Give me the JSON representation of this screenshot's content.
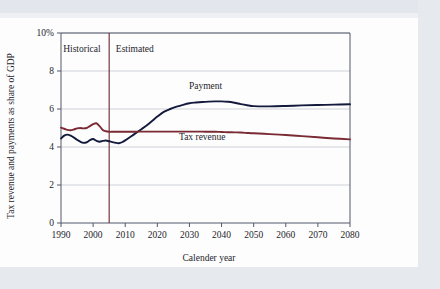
{
  "figure": {
    "background_color": "#fdfdfe",
    "page_edge_color": "#e6e9ee"
  },
  "chart_data": {
    "type": "line",
    "title": "",
    "subtitle": "",
    "xlabel": "Calender year",
    "ylabel": "Tax revenue and payments as share of GDP",
    "xlim": [
      1990,
      2080
    ],
    "ylim": [
      0,
      10
    ],
    "grid": true,
    "grid_axis": "y",
    "legend_position": "inline-annotation",
    "x_ticks": [
      1990,
      2000,
      2010,
      2020,
      2030,
      2040,
      2050,
      2060,
      2070,
      2080
    ],
    "x_tick_labels": [
      "1990",
      "2000",
      "2010",
      "2020",
      "2030",
      "2040",
      "2050",
      "2060",
      "2070",
      "2080"
    ],
    "y_ticks": [
      0,
      2,
      4,
      6,
      8,
      10
    ],
    "y_tick_labels": [
      "0",
      "2",
      "4",
      "6",
      "8",
      "10%"
    ],
    "annotations": [
      {
        "name": "historical-label",
        "text": "Historical",
        "x": 1996.5,
        "y": 9.0
      },
      {
        "name": "estimated-label",
        "text": "Estimated",
        "x": 2013.0,
        "y": 9.0
      },
      {
        "name": "payment-label",
        "text": "Payment",
        "x": 2035.0,
        "y": 7.05
      },
      {
        "name": "tax-revenue-label",
        "text": "Tax revenue",
        "x": 2034.0,
        "y": 4.35
      }
    ],
    "divider": {
      "name": "historical-estimated-divider",
      "x": 2005,
      "color": "#6b2430",
      "label_left": "Historical",
      "label_right": "Estimated"
    },
    "x": [
      1990,
      1991,
      1992,
      1993,
      1994,
      1995,
      1996,
      1997,
      1998,
      1999,
      2000,
      2001,
      2002,
      2003,
      2004,
      2005,
      2006,
      2007,
      2008,
      2009,
      2010,
      2012,
      2014,
      2016,
      2018,
      2020,
      2022,
      2024,
      2026,
      2028,
      2030,
      2032,
      2034,
      2036,
      2038,
      2040,
      2042,
      2044,
      2046,
      2048,
      2050,
      2055,
      2060,
      2065,
      2070,
      2075,
      2080
    ],
    "series": [
      {
        "name": "Payment",
        "color": "#141a3c",
        "values": [
          4.45,
          4.6,
          4.65,
          4.6,
          4.5,
          4.38,
          4.28,
          4.22,
          4.25,
          4.36,
          4.42,
          4.33,
          4.28,
          4.32,
          4.34,
          4.3,
          4.26,
          4.22,
          4.2,
          4.25,
          4.35,
          4.58,
          4.82,
          5.05,
          5.32,
          5.6,
          5.85,
          6.0,
          6.12,
          6.22,
          6.3,
          6.34,
          6.37,
          6.39,
          6.4,
          6.4,
          6.38,
          6.33,
          6.26,
          6.2,
          6.15,
          6.14,
          6.16,
          6.19,
          6.21,
          6.23,
          6.25
        ]
      },
      {
        "name": "Tax revenue",
        "color": "#7a2a33",
        "values": [
          5.02,
          4.96,
          4.9,
          4.88,
          4.92,
          4.98,
          5.0,
          4.98,
          5.0,
          5.1,
          5.2,
          5.25,
          5.1,
          4.9,
          4.83,
          4.8,
          4.8,
          4.8,
          4.8,
          4.8,
          4.8,
          4.8,
          4.81,
          4.81,
          4.81,
          4.81,
          4.81,
          4.81,
          4.81,
          4.81,
          4.81,
          4.81,
          4.81,
          4.8,
          4.8,
          4.79,
          4.78,
          4.77,
          4.76,
          4.74,
          4.72,
          4.68,
          4.63,
          4.57,
          4.51,
          4.45,
          4.4
        ]
      }
    ]
  }
}
